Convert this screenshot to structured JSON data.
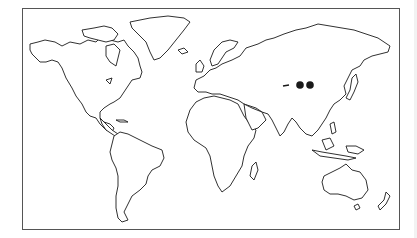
{
  "map": {
    "type": "world-outline",
    "projection": "miller-like",
    "border_color": "#555555",
    "land_stroke": "#1a1a1a",
    "background": "#ffffff",
    "markers": [
      {
        "name": "marker-1",
        "region": "Central Asia (Mongolia)",
        "x": 300,
        "y": 85,
        "r": 3.8,
        "color": "#1a1a1a"
      },
      {
        "name": "marker-2",
        "region": "Central Asia (Mongolia)",
        "x": 310,
        "y": 85,
        "r": 3.8,
        "color": "#1a1a1a"
      }
    ],
    "dash_mark": {
      "x1": 283,
      "y1": 86,
      "x2": 289,
      "y2": 85
    }
  }
}
